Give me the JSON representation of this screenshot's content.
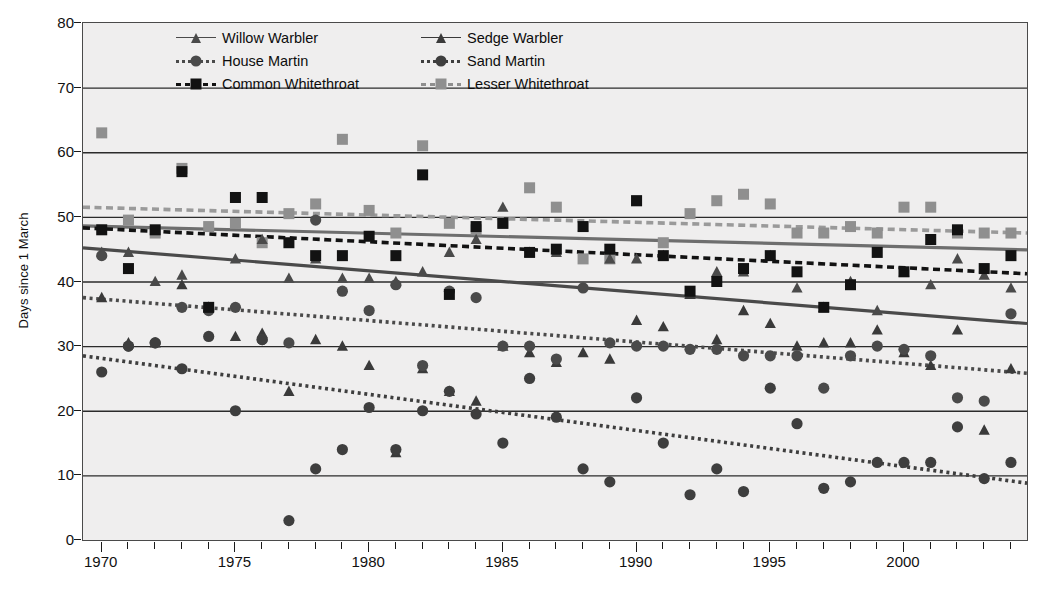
{
  "chart_data": {
    "type": "scatter",
    "title": "",
    "xlabel": "",
    "ylabel": "Days since 1 March",
    "xlim": [
      1969.3,
      2004.6
    ],
    "ylim": [
      0,
      80
    ],
    "yticks": [
      0,
      10,
      20,
      30,
      40,
      50,
      60,
      70,
      80
    ],
    "xticks": [
      1970,
      1975,
      1980,
      1985,
      1990,
      1995,
      2000
    ],
    "xtick_minor_step": 1,
    "grid": "horizontal",
    "legend_position": "top-inside",
    "plot_background": "#efeeee",
    "colors": {
      "dark": "#2b2b2b",
      "mid_gray": "#8a8a8a",
      "axis": "#2b2b2b",
      "trend_dark": "#3a3a3a",
      "trend_gray": "#7d7d7d"
    },
    "series": [
      {
        "name": "Willow Warbler",
        "marker": "triangle",
        "color": "#4a4a4a",
        "line_style": "solid",
        "line_color": "#6e6e6e",
        "trend": {
          "x1": 1969.3,
          "y1": 48.6,
          "x2": 2004.6,
          "y2": 44.9
        },
        "x": [
          1970,
          1971,
          1972,
          1973,
          1974,
          1975,
          1976,
          1977,
          1978,
          1979,
          1980,
          1981,
          1982,
          1983,
          1984,
          1985,
          1986,
          1987,
          1988,
          1989,
          1990,
          1991,
          1992,
          1993,
          1994,
          1995,
          1996,
          1997,
          1998,
          1999,
          2000,
          2001,
          2002,
          2003,
          2004
        ],
        "y": [
          44.5,
          44.5,
          40.0,
          41.0,
          36.0,
          43.5,
          46.5,
          40.5,
          43.5,
          40.5,
          40.5,
          40.0,
          41.5,
          44.5,
          46.5,
          51.5,
          44.5,
          44.5,
          48.5,
          43.5,
          43.5,
          44.0,
          38.0,
          41.5,
          41.5,
          44.0,
          39.0,
          36.0,
          40.0,
          35.5,
          41.5,
          39.5,
          43.5,
          41.0,
          39.0
        ]
      },
      {
        "name": "Sedge Warbler",
        "marker": "triangle",
        "color": "#3a3a3a",
        "line_style": "solid",
        "line_color": "#4a4a4a",
        "trend": {
          "x1": 1969.3,
          "y1": 45.2,
          "x2": 2004.6,
          "y2": 33.5
        },
        "x": [
          1970,
          1971,
          1972,
          1973,
          1974,
          1975,
          1976,
          1977,
          1978,
          1979,
          1980,
          1981,
          1982,
          1983,
          1984,
          1985,
          1986,
          1987,
          1988,
          1989,
          1990,
          1991,
          1992,
          1993,
          1994,
          1995,
          1996,
          1997,
          1998,
          1999,
          2000,
          2001,
          2002,
          2003,
          2004
        ],
        "y": [
          37.5,
          30.5,
          30.5,
          39.5,
          36.0,
          31.5,
          32.0,
          23.0,
          31.0,
          30.0,
          27.0,
          13.5,
          26.5,
          23.0,
          21.5,
          30.0,
          29.0,
          27.5,
          29.0,
          28.0,
          34.0,
          33.0,
          38.0,
          31.0,
          35.5,
          33.5,
          30.0,
          30.5,
          30.5,
          32.5,
          29.0,
          27.0,
          32.5,
          17.0,
          26.5
        ]
      },
      {
        "name": "House Martin",
        "marker": "circle",
        "color": "#4a4a4a",
        "line_style": "dotted",
        "line_color": "#4a4a4a",
        "trend": {
          "x1": 1969.3,
          "y1": 37.5,
          "x2": 2004.6,
          "y2": 25.8
        },
        "x": [
          1970,
          1971,
          1972,
          1973,
          1974,
          1975,
          1976,
          1977,
          1978,
          1979,
          1980,
          1981,
          1982,
          1983,
          1984,
          1985,
          1986,
          1987,
          1988,
          1989,
          1990,
          1991,
          1992,
          1993,
          1994,
          1995,
          1996,
          1997,
          1998,
          1999,
          2000,
          2001,
          2002,
          2003,
          2004
        ],
        "y": [
          44.0,
          30.0,
          30.5,
          36.0,
          35.5,
          36.0,
          31.0,
          30.5,
          49.5,
          38.5,
          35.5,
          39.5,
          27.0,
          38.5,
          37.5,
          30.0,
          30.0,
          28.0,
          39.0,
          30.5,
          30.0,
          30.0,
          29.5,
          29.5,
          28.5,
          28.5,
          28.5,
          23.5,
          28.5,
          30.0,
          29.5,
          28.5,
          22.0,
          21.5,
          35.0
        ]
      },
      {
        "name": "Sand Martin",
        "marker": "circle",
        "color": "#3e3e3e",
        "line_style": "dotted",
        "line_color": "#3e3e3e",
        "trend": {
          "x1": 1969.3,
          "y1": 28.5,
          "x2": 2004.6,
          "y2": 8.8
        },
        "x": [
          1970,
          1971,
          1972,
          1973,
          1974,
          1975,
          1976,
          1977,
          1978,
          1979,
          1980,
          1981,
          1982,
          1983,
          1984,
          1985,
          1986,
          1987,
          1988,
          1989,
          1990,
          1991,
          1992,
          1993,
          1994,
          1995,
          1996,
          1997,
          1998,
          1999,
          2000,
          2001,
          2002,
          2003,
          2004
        ],
        "y": [
          26.0,
          30.0,
          30.5,
          26.5,
          31.5,
          20.0,
          31.0,
          3.0,
          11.0,
          14.0,
          20.5,
          14.0,
          20.0,
          23.0,
          19.5,
          15.0,
          25.0,
          19.0,
          11.0,
          9.0,
          22.0,
          15.0,
          7.0,
          11.0,
          7.5,
          23.5,
          18.0,
          8.0,
          9.0,
          12.0,
          12.0,
          12.0,
          17.5,
          9.5,
          12.0
        ]
      },
      {
        "name": "Common Whitethroat",
        "marker": "square",
        "color": "#121212",
        "line_style": "dashed",
        "line_color": "#121212",
        "trend": {
          "x1": 1969.3,
          "y1": 48.3,
          "x2": 2004.6,
          "y2": 41.2
        },
        "x": [
          1970,
          1971,
          1972,
          1973,
          1974,
          1975,
          1976,
          1977,
          1978,
          1979,
          1980,
          1981,
          1982,
          1983,
          1984,
          1985,
          1986,
          1987,
          1988,
          1989,
          1990,
          1991,
          1992,
          1993,
          1994,
          1995,
          1996,
          1997,
          1998,
          1999,
          2000,
          2001,
          2002,
          2003,
          2004
        ],
        "y": [
          48.0,
          42.0,
          48.0,
          57.0,
          36.0,
          53.0,
          53.0,
          46.0,
          44.0,
          44.0,
          47.0,
          44.0,
          56.5,
          38.0,
          48.5,
          49.0,
          44.5,
          45.0,
          48.5,
          45.0,
          52.5,
          44.0,
          38.5,
          40.0,
          42.0,
          44.0,
          41.5,
          36.0,
          39.5,
          44.5,
          41.5,
          46.5,
          48.0,
          42.0,
          44.0
        ]
      },
      {
        "name": "Lesser Whitethroat",
        "marker": "square",
        "color": "#8f8f8f",
        "line_style": "dashed",
        "line_color": "#9a9a9a",
        "trend": {
          "x1": 1969.3,
          "y1": 51.5,
          "x2": 2004.6,
          "y2": 47.5
        },
        "x": [
          1970,
          1971,
          1972,
          1973,
          1974,
          1975,
          1976,
          1977,
          1978,
          1979,
          1980,
          1981,
          1982,
          1983,
          1984,
          1985,
          1986,
          1987,
          1988,
          1989,
          1990,
          1991,
          1992,
          1993,
          1994,
          1995,
          1996,
          1997,
          1998,
          1999,
          2000,
          2001,
          2002,
          2003,
          2004
        ],
        "y": [
          63.0,
          49.5,
          47.5,
          57.5,
          48.5,
          49.0,
          46.0,
          50.5,
          52.0,
          62.0,
          51.0,
          47.5,
          61.0,
          49.0,
          48.0,
          49.0,
          54.5,
          51.5,
          43.5,
          43.5,
          52.5,
          46.0,
          50.5,
          52.5,
          53.5,
          52.0,
          47.5,
          47.5,
          48.5,
          47.5,
          51.5,
          51.5,
          47.5,
          47.5,
          47.5
        ]
      }
    ]
  },
  "axes": {
    "y_title": "Days since 1 March",
    "y_tick_labels": [
      "80",
      "70",
      "60",
      "50",
      "40",
      "30",
      "20",
      "10",
      "0"
    ],
    "x_tick_labels": [
      "1970",
      "1975",
      "1980",
      "1985",
      "1990",
      "1995",
      "2000"
    ]
  },
  "legend": {
    "entries": [
      {
        "label": "Willow Warbler",
        "marker": "triangle",
        "style": "solid",
        "color": "#4a4a4a"
      },
      {
        "label": "Sedge Warbler",
        "marker": "triangle",
        "style": "solid",
        "color": "#3a3a3a"
      },
      {
        "label": "House Martin",
        "marker": "circle",
        "style": "dotted",
        "color": "#4a4a4a"
      },
      {
        "label": "Sand Martin",
        "marker": "circle",
        "style": "dotted",
        "color": "#3e3e3e"
      },
      {
        "label": "Common Whitethroat",
        "marker": "square",
        "style": "dashed",
        "color": "#121212"
      },
      {
        "label": "Lesser Whitethroat",
        "marker": "square",
        "style": "dashed",
        "color": "#8f8f8f"
      }
    ],
    "order": [
      0,
      1,
      2,
      3,
      4,
      5
    ]
  }
}
